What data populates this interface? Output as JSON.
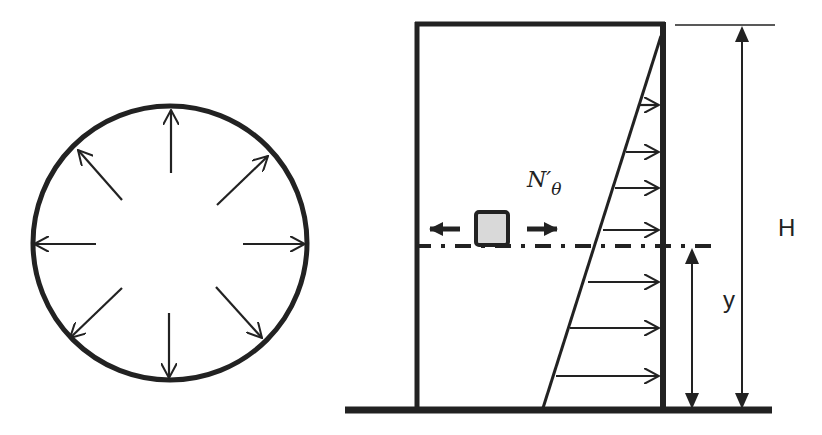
{
  "diagram": {
    "plan_view": {
      "description": "circular tank cross-section with radial pressure arrows",
      "arrow_count": 8
    },
    "elevation_view": {
      "hoop_force_label": "N′",
      "hoop_force_subscript": "θ",
      "height_label": "H",
      "depth_label": "y",
      "pressure_arrow_count": 8
    },
    "colors": {
      "stroke": "#222222",
      "element_fill": "#d9d9d9",
      "background": "#ffffff"
    }
  }
}
